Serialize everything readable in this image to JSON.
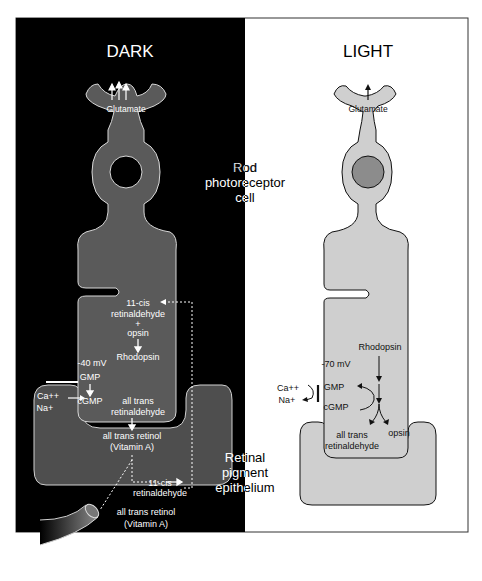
{
  "panels": {
    "dark": {
      "title": "DARK",
      "glutamate": "Glutamate",
      "pathway": {
        "cis_line1": "11-cis",
        "cis_line2": "retinaldehyde",
        "plus": "+",
        "opsin": "opsin",
        "rhodopsin": "Rhodopsin",
        "voltage": "-40 mV",
        "gmp": "GMP",
        "cgmp": "cGMP",
        "trans_ald_line1": "all trans",
        "trans_ald_line2": "retinaldehyde",
        "retinol_line1": "all trans retinol",
        "retinol_line2": "(Vitamin A)"
      },
      "ions": {
        "ca": "Ca++",
        "na": "Na+"
      },
      "epithelium": {
        "cis_line1": "11-cis",
        "cis_line2": "retinaldehyde"
      },
      "vessel": {
        "line1": "all trans retinol",
        "line2": "(Vitamin A)"
      }
    },
    "light": {
      "title": "LIGHT",
      "glutamate": "Glutamate",
      "pathway": {
        "rhodopsin": "Rhodopsin",
        "voltage": "-70 mV",
        "gmp": "GMP",
        "cgmp": "cGMP",
        "trans_ald_line1": "all trans",
        "trans_ald_line2": "retinaldehyde",
        "opsin": "opsin"
      },
      "ions": {
        "ca": "Ca++",
        "na": "Na+"
      }
    }
  },
  "labels": {
    "rod_line1": "Rod",
    "rod_line2": "photoreceptor",
    "rod_line3": "cell",
    "rpe_line1": "Retinal",
    "rpe_line2": "pigment",
    "rpe_line3": "epithelium"
  },
  "colors": {
    "dark_bg": "#000000",
    "dark_cell": "#5a5a5a",
    "light_cell": "#cfcfcf",
    "light_nucleus": "#8c8c8c",
    "outline_light": "#d8d8d8",
    "outline_dark": "#111111"
  }
}
